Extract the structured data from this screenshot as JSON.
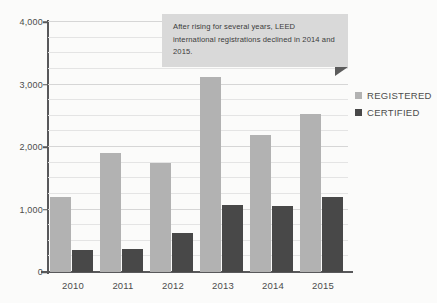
{
  "chart_data": {
    "type": "bar",
    "title": "",
    "xlabel": "",
    "ylabel": "",
    "categories": [
      "2010",
      "2011",
      "2012",
      "2013",
      "2014",
      "2015"
    ],
    "series": [
      {
        "name": "REGISTERED",
        "color": "#b2b2b2",
        "values": [
          1200,
          1900,
          1750,
          3125,
          2200,
          2525
        ]
      },
      {
        "name": "CERTIFIED",
        "color": "#484848",
        "values": [
          350,
          375,
          625,
          1075,
          1050,
          1200
        ]
      }
    ],
    "ylim": [
      0,
      4000
    ],
    "ytick_labels": [
      "0",
      "1,000",
      "2,000",
      "3,000",
      "4,000"
    ],
    "ytick_values": [
      0,
      1000,
      2000,
      3000,
      4000
    ],
    "minor_gridline_step": 250,
    "grid": true,
    "legend_position": "right",
    "annotations": [
      {
        "text": "After rising for several years, LEED international registrations declined in 2014 and 2015.",
        "style": "callout-box"
      }
    ]
  },
  "legend": {
    "items": [
      {
        "label": "REGISTERED",
        "swatch": "#b2b2b2"
      },
      {
        "label": "CERTIFIED",
        "swatch": "#484848"
      }
    ]
  },
  "callout": {
    "text": "After rising for several years, LEED international registrations declined in 2014 and 2015."
  },
  "colors": {
    "registered": "#b2b2b2",
    "certified": "#484848",
    "callout_bg": "#d9d9d9",
    "callout_tail": "#5c5c5c",
    "axis": "#58585a",
    "gridline": "#e4e4e4",
    "background": "#fbfbfa"
  }
}
